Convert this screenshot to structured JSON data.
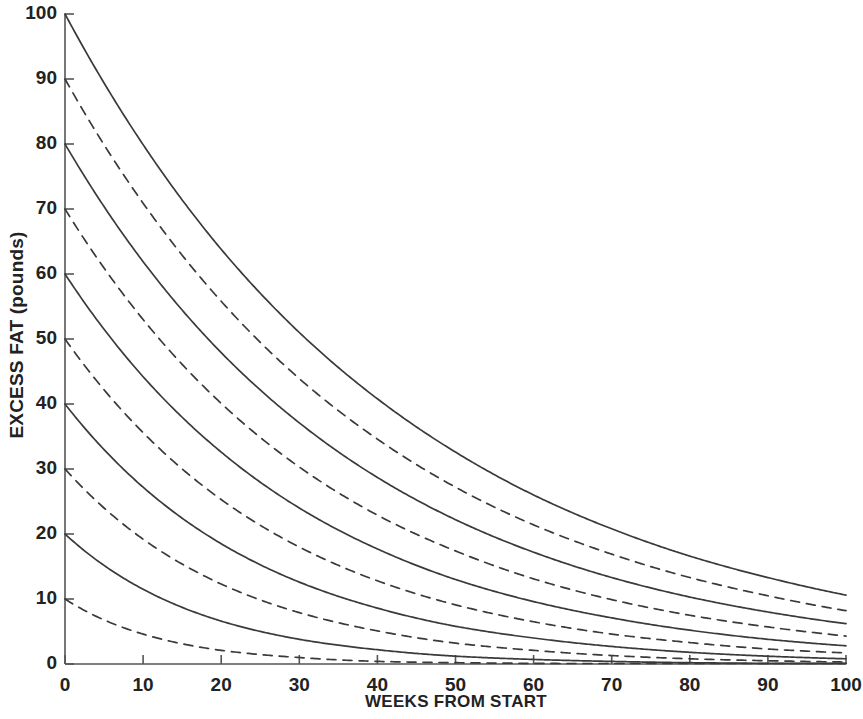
{
  "chart_data": {
    "type": "line",
    "title": "",
    "xlabel": "WEEKS FROM START",
    "ylabel": "EXCESS FAT (pounds)",
    "xlim": [
      0,
      100
    ],
    "ylim": [
      0,
      100
    ],
    "xticks": [
      0,
      10,
      20,
      30,
      40,
      50,
      60,
      70,
      80,
      90,
      100
    ],
    "yticks": [
      0,
      10,
      20,
      30,
      40,
      50,
      60,
      70,
      80,
      90,
      100
    ],
    "xtick_labels": [
      "0",
      "10",
      "20",
      "30",
      "40",
      "50",
      "60",
      "70",
      "80",
      "90",
      "100"
    ],
    "ytick_labels": [
      "0",
      "10",
      "20",
      "30",
      "40",
      "50",
      "60",
      "70",
      "80",
      "90",
      "100"
    ],
    "grid": false,
    "legend": "none",
    "line_color": "#3a3a3a",
    "axis_color": "#555555",
    "series": [
      {
        "name": "100 lb excess fat",
        "start_value": 100,
        "style": "solid",
        "x": [
          0,
          10,
          20,
          30,
          40,
          50,
          60,
          70,
          80,
          90,
          100
        ],
        "values": [
          100,
          79.9,
          63.8,
          51.0,
          40.8,
          32.6,
          26.0,
          20.8,
          16.6,
          13.3,
          10.6
        ]
      },
      {
        "name": "90 lb excess fat",
        "start_value": 90,
        "style": "dashed",
        "x": [
          0,
          10,
          20,
          30,
          40,
          50,
          60,
          70,
          80,
          90,
          100
        ],
        "values": [
          90,
          70.9,
          55.8,
          43.9,
          34.6,
          27.2,
          21.4,
          16.9,
          13.3,
          10.5,
          8.2
        ]
      },
      {
        "name": "80 lb excess fat",
        "start_value": 80,
        "style": "solid",
        "x": [
          0,
          10,
          20,
          30,
          40,
          50,
          60,
          70,
          80,
          90,
          100
        ],
        "values": [
          80,
          61.9,
          47.9,
          37.1,
          28.7,
          22.2,
          17.2,
          13.3,
          10.3,
          8.0,
          6.2
        ]
      },
      {
        "name": "70 lb excess fat",
        "start_value": 70,
        "style": "dashed",
        "x": [
          0,
          10,
          20,
          30,
          40,
          50,
          60,
          70,
          80,
          90,
          100
        ],
        "values": [
          70,
          53.0,
          40.1,
          30.3,
          22.9,
          17.4,
          13.1,
          9.9,
          7.5,
          5.7,
          4.3
        ]
      },
      {
        "name": "60 lb excess fat",
        "start_value": 60,
        "style": "solid",
        "x": [
          0,
          10,
          20,
          30,
          40,
          50,
          60,
          70,
          80,
          90,
          100
        ],
        "values": [
          60,
          44.2,
          32.6,
          24.0,
          17.7,
          13.0,
          9.6,
          7.1,
          5.2,
          3.8,
          2.8
        ]
      },
      {
        "name": "50 lb excess fat",
        "start_value": 50,
        "style": "dashed",
        "x": [
          0,
          10,
          20,
          30,
          40,
          50,
          60,
          70,
          80,
          90,
          100
        ],
        "values": [
          50,
          35.6,
          25.3,
          18.0,
          12.8,
          9.1,
          6.5,
          4.6,
          3.3,
          2.3,
          1.7
        ]
      },
      {
        "name": "40 lb excess fat",
        "start_value": 40,
        "style": "solid",
        "x": [
          0,
          10,
          20,
          30,
          40,
          50,
          60,
          70,
          80,
          90,
          100
        ],
        "values": [
          40,
          27.2,
          18.5,
          12.6,
          8.6,
          5.8,
          4.0,
          2.7,
          1.8,
          1.2,
          0.8
        ]
      },
      {
        "name": "30 lb excess fat",
        "start_value": 30,
        "style": "dashed",
        "x": [
          0,
          10,
          20,
          30,
          40,
          50,
          60,
          70,
          80,
          90,
          100
        ],
        "values": [
          30,
          19.2,
          12.3,
          7.9,
          5.1,
          3.2,
          2.1,
          1.3,
          0.8,
          0.5,
          0.3
        ]
      },
      {
        "name": "20 lb excess fat",
        "start_value": 20,
        "style": "solid",
        "x": [
          0,
          10,
          20,
          30,
          40,
          50,
          60,
          70,
          80,
          90,
          100
        ],
        "values": [
          20,
          11.5,
          6.6,
          3.8,
          2.2,
          1.2,
          0.7,
          0.4,
          0.2,
          0.1,
          0.1
        ]
      },
      {
        "name": "10 lb excess fat",
        "start_value": 10,
        "style": "dashed",
        "x": [
          0,
          10,
          20,
          30,
          40,
          50,
          60,
          70,
          80,
          90,
          100
        ],
        "values": [
          10,
          4.6,
          2.1,
          1.0,
          0.4,
          0.2,
          0.1,
          0.05,
          0.02,
          0.01,
          0.0
        ]
      }
    ]
  }
}
